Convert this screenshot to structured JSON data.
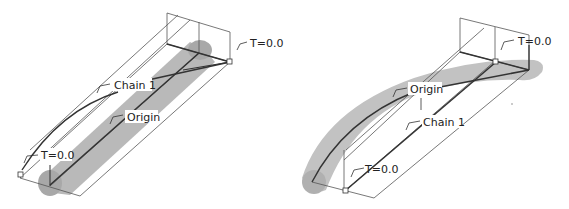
{
  "figure": {
    "colors": {
      "background": "#ffffff",
      "surface": "#b8b8b8",
      "surface_dark": "#9a9a9a",
      "edge": "#444444",
      "thin_line": "#555555",
      "label_text": "#222222"
    }
  },
  "left_view": {
    "labels": {
      "t_top": "T=0.0",
      "chain": "Chain 1",
      "origin": "Origin",
      "t_bottom": "T=0.0"
    }
  },
  "right_view": {
    "labels": {
      "t_top": "T=0.0",
      "origin": "Origin",
      "chain": "Chain 1",
      "t_bottom": "T=0.0"
    }
  }
}
